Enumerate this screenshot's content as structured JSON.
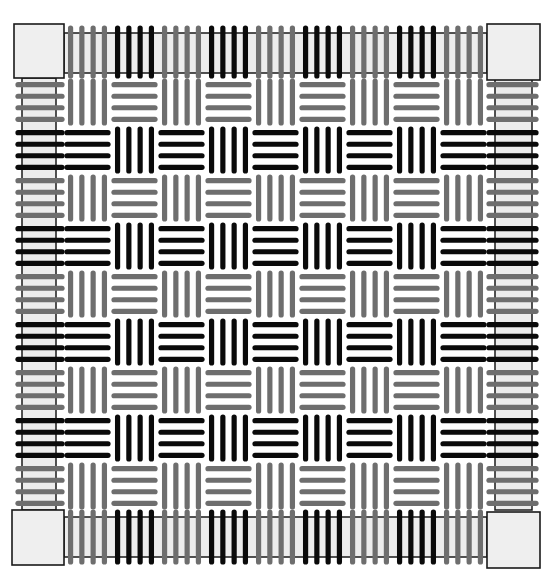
{
  "figure": {
    "title": "Basket weave pattern",
    "grid": {
      "rows": 9,
      "cols": 9,
      "sticks_per_cell": 4
    },
    "colors": {
      "background": "#ffffff",
      "gray_stick": "#6e6e6e",
      "black_stick": "#0a0a0a",
      "frame_fill": "#ececec",
      "frame_stroke": "#1a1a1a",
      "corner_fill": "#efefef"
    },
    "geometry": {
      "inner_left": 64,
      "inner_right": 487,
      "inner_top": 78,
      "inner_bottom": 510,
      "frame_outer_left": 14,
      "frame_outer_right": 540,
      "frame_outer_top": 24,
      "frame_outer_bottom": 566
    },
    "legend": [
      {
        "name": "gray-row",
        "rows": [
          0,
          2,
          4,
          6,
          8
        ],
        "rule": "even column vertical, odd column horizontal"
      },
      {
        "name": "black-row",
        "rows": [
          1,
          3,
          5,
          7
        ],
        "rule": "even column horizontal, odd column vertical"
      }
    ],
    "corners": [
      "top-left",
      "top-right",
      "bottom-left",
      "bottom-right"
    ]
  }
}
